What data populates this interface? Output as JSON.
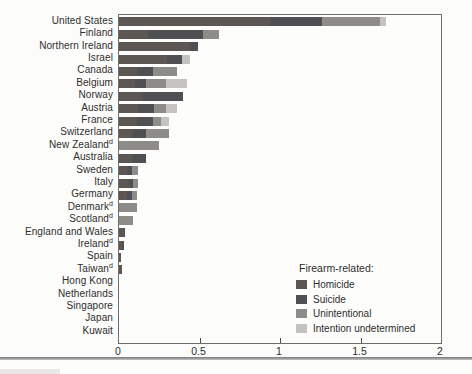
{
  "chart_data": {
    "type": "bar",
    "orientation": "horizontal",
    "stacked": true,
    "title": "",
    "xlabel": "",
    "ylabel": "",
    "xlim": [
      0,
      2
    ],
    "grid": false,
    "legend_position": "inside bottom-right",
    "legend_title": "Firearm-related:",
    "xticks": [
      {
        "value": 0,
        "label": "0"
      },
      {
        "value": 0.5,
        "label": "0.5"
      },
      {
        "value": 1,
        "label": "1"
      },
      {
        "value": 1.5,
        "label": "1.5"
      },
      {
        "value": 2,
        "label": "2"
      }
    ],
    "series": [
      {
        "key": "homicide",
        "name": "Homicide",
        "color": "#5d5754"
      },
      {
        "key": "suicide",
        "name": "Suicide",
        "color": "#504f54"
      },
      {
        "key": "unintentional",
        "name": "Unintentional",
        "color": "#8e8c89"
      },
      {
        "key": "undetermined",
        "name": "Intention undetermined",
        "color": "#c5c3bf"
      }
    ],
    "countries": [
      {
        "label": "United States",
        "sup": "",
        "values": [
          0.94,
          0.32,
          0.36,
          0.04
        ]
      },
      {
        "label": "Finland",
        "sup": "",
        "values": [
          0.18,
          0.34,
          0.1,
          0
        ]
      },
      {
        "label": "Northern Ireland",
        "sup": "",
        "values": [
          0.44,
          0.05,
          0,
          0
        ]
      },
      {
        "label": "Israel",
        "sup": "",
        "values": [
          0.3,
          0.09,
          0,
          0.05
        ]
      },
      {
        "label": "Canada",
        "sup": "",
        "values": [
          0.11,
          0.1,
          0.15,
          0
        ]
      },
      {
        "label": "Belgium",
        "sup": "",
        "values": [
          0.1,
          0.07,
          0.12,
          0.13
        ]
      },
      {
        "label": "Norway",
        "sup": "",
        "values": [
          0.15,
          0.25,
          0,
          0
        ]
      },
      {
        "label": "Austria",
        "sup": "",
        "values": [
          0.12,
          0.1,
          0.07,
          0.07
        ]
      },
      {
        "label": "France",
        "sup": "",
        "values": [
          0.11,
          0.1,
          0.05,
          0.05
        ]
      },
      {
        "label": "Switzerland",
        "sup": "",
        "values": [
          0.09,
          0.08,
          0.14,
          0
        ]
      },
      {
        "label": "New Zealand",
        "sup": "d",
        "values": [
          0,
          0,
          0.25,
          0
        ]
      },
      {
        "label": "Australia",
        "sup": "",
        "values": [
          0.09,
          0.08,
          0,
          0
        ]
      },
      {
        "label": "Sweden",
        "sup": "",
        "values": [
          0.05,
          0.03,
          0.04,
          0
        ]
      },
      {
        "label": "Italy",
        "sup": "",
        "values": [
          0.06,
          0.03,
          0.03,
          0
        ]
      },
      {
        "label": "Germany",
        "sup": "",
        "values": [
          0.05,
          0.03,
          0.03,
          0
        ]
      },
      {
        "label": "Denmark",
        "sup": "d",
        "values": [
          0,
          0,
          0.11,
          0
        ]
      },
      {
        "label": "Scotland",
        "sup": "d",
        "values": [
          0,
          0,
          0.09,
          0
        ]
      },
      {
        "label": "England and Wales",
        "sup": "",
        "values": [
          0.03,
          0.01,
          0,
          0
        ]
      },
      {
        "label": "Ireland",
        "sup": "d",
        "values": [
          0.02,
          0.01,
          0,
          0
        ]
      },
      {
        "label": "Spain",
        "sup": "",
        "values": [
          0.01,
          0,
          0,
          0
        ]
      },
      {
        "label": "Taiwan",
        "sup": "d",
        "values": [
          0.02,
          0,
          0,
          0
        ]
      },
      {
        "label": "Hong Kong",
        "sup": "",
        "values": [
          0,
          0,
          0,
          0
        ]
      },
      {
        "label": "Netherlands",
        "sup": "",
        "values": [
          0,
          0,
          0,
          0
        ]
      },
      {
        "label": "Singapore",
        "sup": "",
        "values": [
          0,
          0,
          0,
          0
        ]
      },
      {
        "label": "Japan",
        "sup": "",
        "values": [
          0,
          0,
          0,
          0
        ]
      },
      {
        "label": "Kuwait",
        "sup": "",
        "values": [
          0,
          0,
          0,
          0
        ]
      }
    ]
  }
}
